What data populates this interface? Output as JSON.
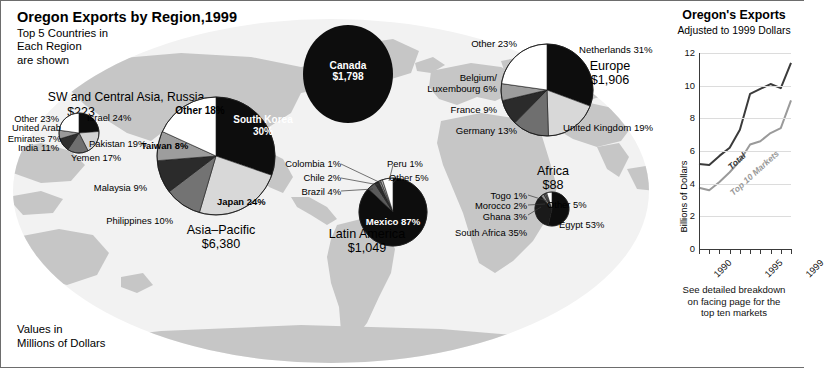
{
  "map_panel": {
    "title": "Oregon Exports by Region,1999",
    "subtitle": "Top 5 Countries in\nEach Region\nare shown",
    "values_note": "Values in\nMillions of Dollars"
  },
  "regions": [
    {
      "key": "sw_central_asia",
      "name": "SW and Central Asia, Russia",
      "value": "$223",
      "slices": [
        {
          "label": "Israel 24%",
          "country": "Israel",
          "percent": 24,
          "shade": "#0d0d0d"
        },
        {
          "label": "Pakistan 19%",
          "country": "Pakistan",
          "percent": 19,
          "shade": "#d3d3d3"
        },
        {
          "label": "Yemen 17%",
          "country": "Yemen",
          "percent": 17,
          "shade": "#6f6f6f"
        },
        {
          "label": "India 11%",
          "country": "India",
          "percent": 11,
          "shade": "#2f2f2f"
        },
        {
          "label": "United Arab\nEmirates 7%",
          "country": "United Arab Emirates",
          "percent": 7,
          "shade": "#9a9a9a"
        },
        {
          "label": "Other 23%",
          "country": "Other",
          "percent": 23,
          "shade": "#ffffff"
        }
      ]
    },
    {
      "key": "asia_pacific",
      "name": "Asia–Pacific",
      "value": "$6,380",
      "slices": [
        {
          "label": "South Korea\n30%",
          "country": "South Korea",
          "percent": 30,
          "shade": "#0d0d0d"
        },
        {
          "label": "Japan 24%",
          "country": "Japan",
          "percent": 24,
          "shade": "#d8d8d8"
        },
        {
          "label": "Philippines 10%",
          "country": "Philippines",
          "percent": 10,
          "shade": "#737373"
        },
        {
          "label": "Malaysia 9%",
          "country": "Malaysia",
          "percent": 9,
          "shade": "#2b2b2b"
        },
        {
          "label": "Taiwan 8%",
          "country": "Taiwan",
          "percent": 8,
          "shade": "#9d9d9d"
        },
        {
          "label": "Other 18%",
          "country": "Other",
          "percent": 18,
          "shade": "#ffffff"
        }
      ]
    },
    {
      "key": "canada",
      "name": "Canada",
      "value": "$1,798",
      "slices": [
        {
          "label": "Canada 100%",
          "country": "Canada",
          "percent": 100,
          "shade": "#0d0d0d"
        }
      ]
    },
    {
      "key": "europe",
      "name": "Europe",
      "value": "$1,906",
      "slices": [
        {
          "label": "Netherlands 31%",
          "country": "Netherlands",
          "percent": 31,
          "shade": "#0d0d0d"
        },
        {
          "label": "United Kingdom 19%",
          "country": "United Kingdom",
          "percent": 19,
          "shade": "#d8d8d8"
        },
        {
          "label": "Germany 13%",
          "country": "Germany",
          "percent": 13,
          "shade": "#6f6f6f"
        },
        {
          "label": "France 9%",
          "country": "France",
          "percent": 9,
          "shade": "#2b2b2b"
        },
        {
          "label": "Belgium/\nLuxembourg 6%",
          "country": "Belgium/Luxembourg",
          "percent": 6,
          "shade": "#9d9d9d"
        },
        {
          "label": "Other 23%",
          "country": "Other",
          "percent": 23,
          "shade": "#ffffff"
        }
      ]
    },
    {
      "key": "latin_america",
      "name": "Latin America",
      "value": "$1,049",
      "slices": [
        {
          "label": "Mexico 87%",
          "country": "Mexico",
          "percent": 87,
          "shade": "#0d0d0d"
        },
        {
          "label": "Brazil 4%",
          "country": "Brazil",
          "percent": 4,
          "shade": "#5a5a5a"
        },
        {
          "label": "Chile 2%",
          "country": "Chile",
          "percent": 2,
          "shade": "#2b2b2b"
        },
        {
          "label": "Colombia 1%",
          "country": "Colombia",
          "percent": 1,
          "shade": "#8f8f8f"
        },
        {
          "label": "Peru 1%",
          "country": "Peru",
          "percent": 1,
          "shade": "#bdbdbd"
        },
        {
          "label": "Other 5%",
          "country": "Other",
          "percent": 5,
          "shade": "#ffffff"
        }
      ]
    },
    {
      "key": "africa",
      "name": "Africa",
      "value": "$88",
      "slices": [
        {
          "label": "Egypt 53%",
          "country": "Egypt",
          "percent": 53,
          "shade": "#0d0d0d"
        },
        {
          "label": "South Africa 35%",
          "country": "South Africa",
          "percent": 35,
          "shade": "#1a1a1a"
        },
        {
          "label": "Ghana 3%",
          "country": "Ghana",
          "percent": 3,
          "shade": "#8f8f8f"
        },
        {
          "label": "Morocco 2%",
          "country": "Morocco",
          "percent": 2,
          "shade": "#5a5a5a"
        },
        {
          "label": "Togo 1%",
          "country": "Togo",
          "percent": 1,
          "shade": "#c2c2c2"
        },
        {
          "label": "Other 5%",
          "country": "Other",
          "percent": 5,
          "shade": "#ffffff"
        }
      ]
    }
  ],
  "line_panel": {
    "title": "Oregon's Exports",
    "subtitle": "Adjusted to 1999 Dollars",
    "caption": "See detailed breakdown\non facing page for the\ntop ten markets"
  },
  "chart_data": {
    "type": "line",
    "title": "Oregon's Exports",
    "subtitle": "Adjusted to 1999 Dollars",
    "xlabel": "",
    "ylabel": "Billions of Dollars",
    "ylim": [
      0,
      12
    ],
    "yticks": [
      0,
      2,
      4,
      6,
      8,
      10,
      12
    ],
    "ytick_labels": [
      "0",
      "2",
      "4",
      "6",
      "8",
      "10",
      "12"
    ],
    "x": [
      1990,
      1991,
      1992,
      1993,
      1994,
      1995,
      1996,
      1997,
      1998,
      1999
    ],
    "xtick_labels": [
      "1990",
      "1995",
      "1999"
    ],
    "xticks_shown": [
      1990,
      1995,
      1999
    ],
    "grid": true,
    "legend": "inline-labels",
    "series": [
      {
        "name": "Total",
        "color": "#3b3b3b",
        "values": [
          5.2,
          5.15,
          5.7,
          6.2,
          7.3,
          9.5,
          9.8,
          10.1,
          9.85,
          11.4
        ]
      },
      {
        "name": "Top 10 Markets",
        "color": "#9a9a9a",
        "values": [
          3.75,
          3.6,
          4.1,
          4.7,
          5.4,
          6.4,
          6.6,
          7.1,
          7.4,
          9.1
        ]
      }
    ]
  }
}
